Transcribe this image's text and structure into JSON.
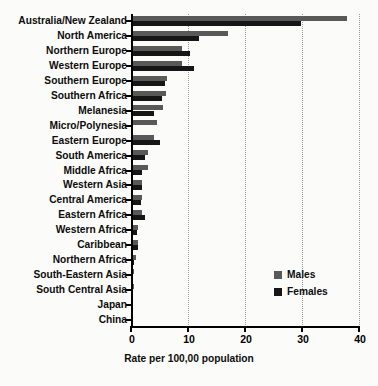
{
  "chart_data": {
    "type": "bar",
    "orientation": "horizontal",
    "title": "",
    "xlabel": "Rate per 100,00 population",
    "ylabel": "",
    "xlim": [
      0,
      40
    ],
    "xticks": [
      0,
      10,
      20,
      30,
      40
    ],
    "xtick_labels": [
      "0",
      "10",
      "20",
      "30",
      "40"
    ],
    "grid": true,
    "grid_axis": "x",
    "legend_position": "middle-right",
    "categories": [
      "Australia/New Zealand",
      "North America",
      "Northern Europe",
      "Western Europe",
      "Southern Europe",
      "Southern Africa",
      "Melanesia",
      "Micro/Polynesia",
      "Eastern Europe",
      "South America",
      "Middle Africa",
      "Western Asia",
      "Central America",
      "Eastern Africa",
      "Western Africa",
      "Caribbean",
      "Northern Africa",
      "South-Eastern Asia",
      "South Central Asia",
      "Japan",
      "China"
    ],
    "series": [
      {
        "name": "Males",
        "color": "#595959",
        "values": [
          37.9,
          17.0,
          9.0,
          9.0,
          6.4,
          6.2,
          5.6,
          4.5,
          4.0,
          3.0,
          2.9,
          2.0,
          1.9,
          2.0,
          1.3,
          1.3,
          0.8,
          0.5,
          0.5,
          0.4,
          0.3
        ]
      },
      {
        "name": "Females",
        "color": "#161616",
        "values": [
          29.8,
          12.0,
          10.3,
          11.0,
          6.0,
          5.5,
          4.0,
          0.2,
          5.0,
          2.5,
          2.0,
          2.0,
          1.8,
          2.5,
          1.0,
          1.2,
          0.5,
          0.4,
          0.4,
          0.3,
          0.2
        ]
      }
    ]
  },
  "legend": {
    "items": [
      {
        "label": "Males",
        "swatch": "male"
      },
      {
        "label": "Females",
        "swatch": "female"
      }
    ]
  }
}
